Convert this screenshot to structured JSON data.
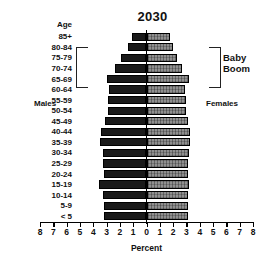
{
  "chart_data": {
    "type": "bar",
    "subtype": "population-pyramid",
    "title": "2030",
    "xlabel": "Percent",
    "ylabel": "Age",
    "xlim": [
      -8,
      8
    ],
    "xticks": [
      8,
      7,
      6,
      5,
      4,
      3,
      2,
      1,
      0,
      1,
      2,
      3,
      4,
      5,
      6,
      7,
      8
    ],
    "grid": false,
    "legend_position": "inline",
    "categories": [
      "85+",
      "80-84",
      "75-79",
      "70-74",
      "65-69",
      "60-64",
      "55-59",
      "50-54",
      "45-49",
      "40-44",
      "35-39",
      "30-34",
      "25-29",
      "20-24",
      "15-19",
      "10-14",
      "5-9",
      "< 5"
    ],
    "series": [
      {
        "name": "Males",
        "side": "left",
        "color": "#1a1a1a",
        "values": [
          1.1,
          1.4,
          1.9,
          2.4,
          3.0,
          2.8,
          2.9,
          2.9,
          3.1,
          3.4,
          3.5,
          3.3,
          3.3,
          3.2,
          3.6,
          3.3,
          3.2,
          3.2
        ]
      },
      {
        "name": "Females",
        "side": "right",
        "color": "#8f8f8f",
        "values": [
          1.8,
          2.0,
          2.3,
          2.7,
          3.2,
          2.9,
          3.0,
          3.0,
          3.1,
          3.3,
          3.3,
          3.2,
          3.1,
          3.1,
          3.2,
          3.1,
          3.1,
          3.1
        ]
      }
    ],
    "annotations": [
      {
        "name": "baby-boom",
        "label_line1": "Baby",
        "label_line2": "Boom",
        "spans": [
          "80-84",
          "65-69"
        ]
      }
    ]
  },
  "labels": {
    "age_header": "Age",
    "males": "Males",
    "females": "Females",
    "percent": "Percent",
    "baby_boom_line1": "Baby",
    "baby_boom_line2": "Boom"
  }
}
